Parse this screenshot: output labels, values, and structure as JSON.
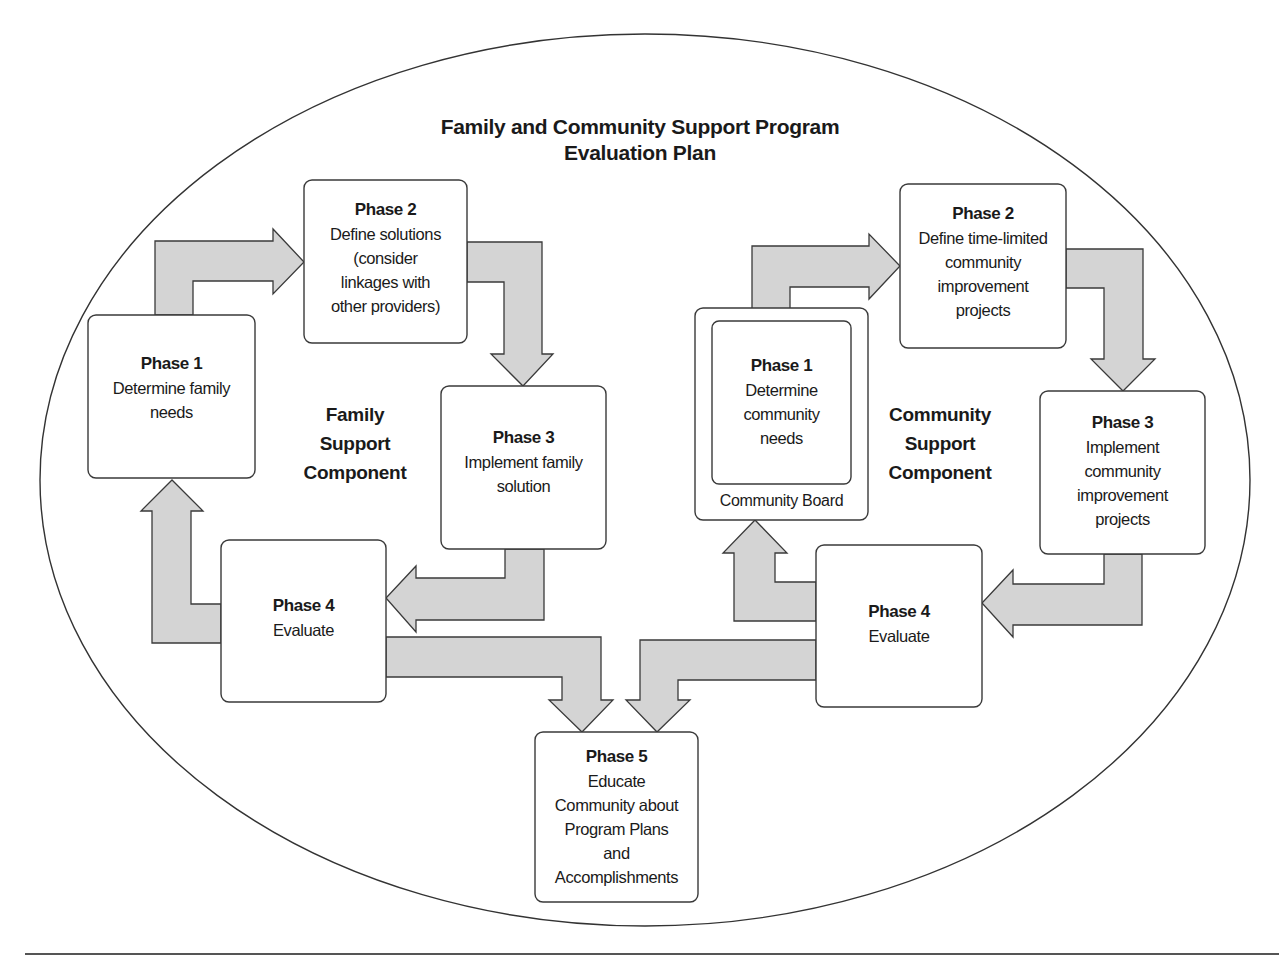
{
  "title": {
    "line1": "Family and Community Support Program",
    "line2": "Evaluation Plan"
  },
  "family": {
    "component_label": "Family\nSupport\nComponent",
    "phases": [
      {
        "phase": "Phase 1",
        "desc": "Determine family\nneeds"
      },
      {
        "phase": "Phase 2",
        "desc": "Define solutions\n(consider\nlinkages with\nother providers)"
      },
      {
        "phase": "Phase 3",
        "desc": "Implement family\nsolution"
      },
      {
        "phase": "Phase 4",
        "desc": "Evaluate"
      }
    ]
  },
  "community": {
    "component_label": "Community\nSupport\nComponent",
    "board_label": "Community Board",
    "phases": [
      {
        "phase": "Phase 1",
        "desc": "Determine\ncommunity\nneeds"
      },
      {
        "phase": "Phase 2",
        "desc": "Define time-limited\ncommunity\nimprovement\nprojects"
      },
      {
        "phase": "Phase 3",
        "desc": "Implement\ncommunity\nimprovement\nprojects"
      },
      {
        "phase": "Phase 4",
        "desc": "Evaluate"
      }
    ]
  },
  "shared": {
    "phase5": {
      "phase": "Phase 5",
      "desc": "Educate\nCommunity about\nProgram Plans\nand\nAccomplishments"
    }
  },
  "colors": {
    "arrow_fill": "#d4d4d4",
    "stroke": "#3a3a3a",
    "background": "#ffffff"
  }
}
